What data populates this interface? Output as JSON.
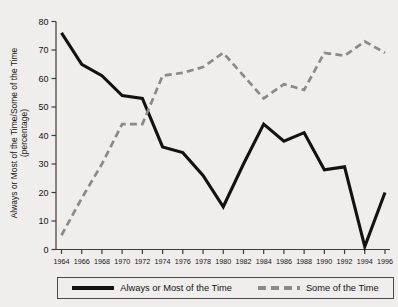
{
  "chart_data": {
    "type": "line",
    "title": "",
    "xlabel": "",
    "ylabel": "Always or Most of the Time/Some of the Time (percentage)",
    "ylabel_line1": "Always or Most of the Time/Some of the Time",
    "ylabel_line2": "(percentage)",
    "categories": [
      1964,
      1966,
      1968,
      1970,
      1972,
      1974,
      1976,
      1978,
      1980,
      1982,
      1984,
      1986,
      1988,
      1990,
      1992,
      1994,
      1996
    ],
    "x_tick_labels": [
      "1964",
      "1966",
      "1968",
      "1970",
      "1972",
      "1974",
      "1976",
      "1978",
      "1980",
      "1982",
      "1984",
      "1986",
      "1988",
      "1990",
      "1992",
      "1994",
      "1996"
    ],
    "y_tick_labels": [
      "0",
      "10",
      "20",
      "30",
      "40",
      "50",
      "60",
      "70",
      "80"
    ],
    "y_ticks": [
      0,
      10,
      20,
      30,
      40,
      50,
      60,
      70,
      80
    ],
    "ylim": [
      0,
      80
    ],
    "xlim": [
      1964,
      1996
    ],
    "grid": false,
    "legend_position": "bottom",
    "series": [
      {
        "name": "Always or Most of the Time",
        "style": "solid",
        "color": "#121212",
        "values": [
          76,
          65,
          61,
          54,
          53,
          36,
          34,
          26,
          15,
          30,
          44,
          38,
          41,
          28,
          29,
          1,
          20
        ]
      },
      {
        "name": "Some of the Time",
        "style": "dashed",
        "color": "#8a8a8a",
        "values": [
          5,
          18,
          30,
          44,
          44,
          61,
          62,
          64,
          69,
          61,
          53,
          58,
          56,
          69,
          68,
          73,
          69
        ]
      }
    ]
  },
  "legend": {
    "entries": [
      {
        "label": "Always or Most of the Time",
        "style": "solid"
      },
      {
        "label": "Some of the Time",
        "style": "dashed"
      }
    ]
  },
  "colors": {
    "background": "#efeeec",
    "axis": "#3c3c3c",
    "series_solid": "#121212",
    "series_dashed": "#8a8a8a"
  }
}
